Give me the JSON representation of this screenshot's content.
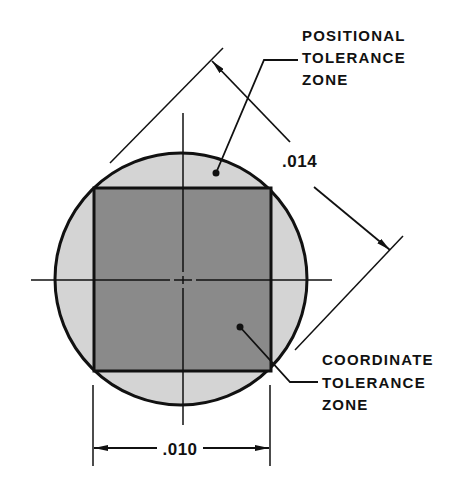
{
  "diagram": {
    "colors": {
      "background": "#ffffff",
      "ink": "#111111",
      "positional_zone_fill": "#d4d4d4",
      "coordinate_zone_fill": "#8a8a8a"
    },
    "positional_label": {
      "line1": "POSITIONAL",
      "line2": "TOLERANCE",
      "line3": "ZONE"
    },
    "coordinate_label": {
      "line1": "COORDINATE",
      "line2": "TOLERANCE",
      "line3": "ZONE"
    },
    "dimensions": {
      "diagonal": ".014",
      "horizontal": ".010"
    }
  }
}
